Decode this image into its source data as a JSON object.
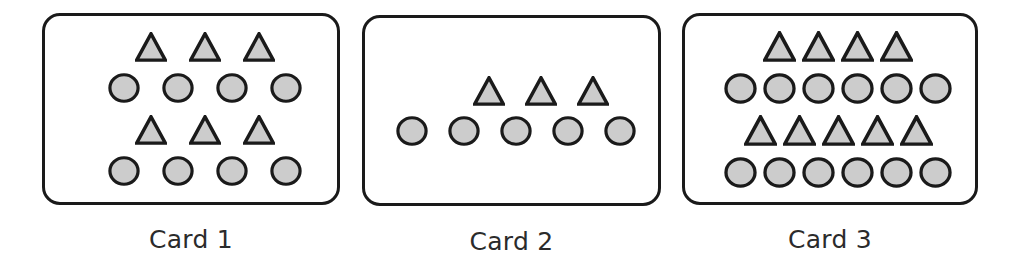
{
  "figure": {
    "background_color": "#ffffff",
    "shape_fill_color": "#cccccc",
    "shape_stroke_color": "#1a1a1a",
    "card_border_color": "#1a1a1a",
    "label_color": "#2b2b2b"
  },
  "cards": [
    {
      "label": "Card 1",
      "rows": [
        {
          "shape": "triangle",
          "count": 3
        },
        {
          "shape": "circle",
          "count": 4
        },
        {
          "shape": "triangle",
          "count": 3
        },
        {
          "shape": "circle",
          "count": 4
        }
      ],
      "totals": {
        "triangles": 6,
        "circles": 8,
        "shapes": 14
      }
    },
    {
      "label": "Card 2",
      "rows": [
        {
          "shape": "triangle",
          "count": 3
        },
        {
          "shape": "circle",
          "count": 5
        }
      ],
      "totals": {
        "triangles": 3,
        "circles": 5,
        "shapes": 8
      }
    },
    {
      "label": "Card 3",
      "rows": [
        {
          "shape": "triangle",
          "count": 4
        },
        {
          "shape": "circle",
          "count": 6
        },
        {
          "shape": "triangle",
          "count": 5
        },
        {
          "shape": "circle",
          "count": 6
        }
      ],
      "totals": {
        "triangles": 9,
        "circles": 12,
        "shapes": 21
      }
    }
  ]
}
